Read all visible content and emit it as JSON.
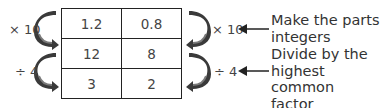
{
  "table": {
    "rows": [
      [
        "1.2",
        "0.8"
      ],
      [
        "12",
        "8"
      ],
      [
        "3",
        "2"
      ]
    ]
  },
  "operations": {
    "left": [
      {
        "label": "× 10"
      },
      {
        "label": "÷ 4"
      }
    ],
    "right": [
      {
        "label": "× 10"
      },
      {
        "label": "÷ 4"
      }
    ]
  },
  "notes": [
    {
      "line1": "Make the parts",
      "line2": "integers",
      "line3": ""
    },
    {
      "line1": "Divide by the",
      "line2": "highest common",
      "line3": "factor"
    }
  ],
  "colors": {
    "arrow_fill": "#3a3a3a",
    "arrow_highlight": "#7a7a7a",
    "border": "#222222",
    "text": "#444444"
  }
}
